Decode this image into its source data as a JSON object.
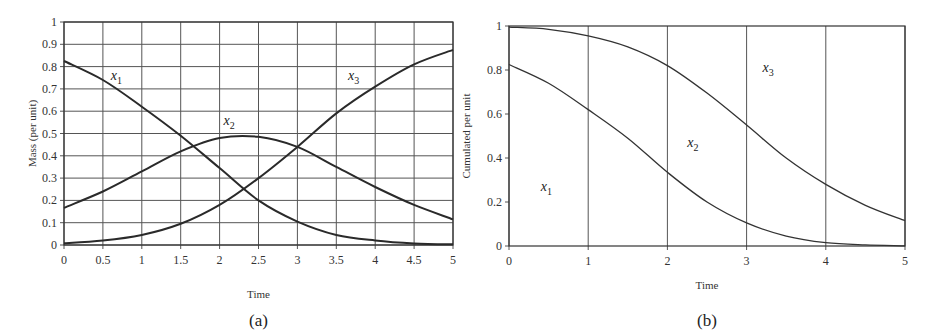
{
  "chart_data": [
    {
      "id": "a",
      "type": "line",
      "caption": "(a)",
      "title": "",
      "xlabel": "Time",
      "ylabel": "Mass (per unit)",
      "xlim": [
        0,
        5
      ],
      "ylim": [
        0,
        1
      ],
      "xticks": [
        "0",
        "0.5",
        "1",
        "1.5",
        "2",
        "2.5",
        "3",
        "3.5",
        "4",
        "4.5",
        "5"
      ],
      "yticks": [
        "0",
        "0.1",
        "0.2",
        "0.3",
        "0.4",
        "0.5",
        "0.6",
        "0.7",
        "0.8",
        "0.9",
        "1"
      ],
      "grid": true,
      "legend": "inline labels",
      "x": [
        0,
        0.5,
        1,
        1.5,
        2,
        2.5,
        3,
        3.5,
        4,
        4.5,
        5
      ],
      "series": [
        {
          "name": "x1",
          "label_main": "x",
          "label_sub": "1",
          "label_pos": [
            0.6,
            0.74
          ],
          "values": [
            0.825,
            0.74,
            0.62,
            0.49,
            0.345,
            0.2,
            0.105,
            0.045,
            0.02,
            0.007,
            0.003
          ]
        },
        {
          "name": "x2",
          "label_main": "x",
          "label_sub": "2",
          "label_pos": [
            2.05,
            0.54
          ],
          "values": [
            0.167,
            0.24,
            0.33,
            0.42,
            0.48,
            0.485,
            0.44,
            0.35,
            0.26,
            0.18,
            0.115
          ]
        },
        {
          "name": "x3",
          "label_main": "x",
          "label_sub": "3",
          "label_pos": [
            3.65,
            0.74
          ],
          "values": [
            0.008,
            0.02,
            0.045,
            0.095,
            0.18,
            0.3,
            0.44,
            0.59,
            0.71,
            0.81,
            0.875
          ]
        }
      ]
    },
    {
      "id": "b",
      "type": "area",
      "caption": "(b)",
      "title": "",
      "xlabel": "Time",
      "ylabel": "Cumulated per unit",
      "xlim": [
        0,
        5
      ],
      "ylim": [
        0,
        1
      ],
      "xticks": [
        "0",
        "1",
        "2",
        "3",
        "4",
        "5"
      ],
      "yticks": [
        "0",
        "0.2",
        "0.4",
        "0.6",
        "0.8",
        "1"
      ],
      "grid": "vertical only",
      "legend": "inline region labels",
      "x": [
        0,
        0.5,
        1,
        1.5,
        2,
        2.5,
        3,
        3.5,
        4,
        4.5,
        5
      ],
      "series": [
        {
          "name": "x1",
          "label_main": "x",
          "label_sub": "1",
          "label_pos": [
            0.4,
            0.25
          ],
          "values": [
            0.825,
            0.74,
            0.62,
            0.49,
            0.335,
            0.2,
            0.105,
            0.045,
            0.015,
            0.005,
            0.001
          ]
        },
        {
          "name": "x1+x2",
          "label_main": "x",
          "label_sub": "2",
          "label_pos": [
            2.25,
            0.45
          ],
          "values": [
            0.995,
            0.985,
            0.955,
            0.905,
            0.82,
            0.695,
            0.55,
            0.4,
            0.28,
            0.185,
            0.115
          ]
        },
        {
          "name": "x3",
          "label_main": "x",
          "label_sub": "3",
          "label_pos": [
            3.2,
            0.79
          ],
          "values": [
            1,
            1,
            1,
            1,
            1,
            1,
            1,
            1,
            1,
            1,
            1
          ]
        }
      ]
    }
  ]
}
